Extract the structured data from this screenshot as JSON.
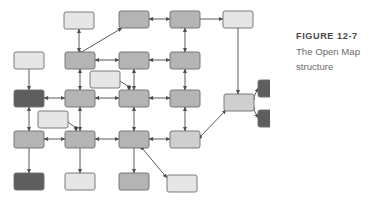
{
  "figure": {
    "label": "FIGURE 12-7",
    "caption": "The Open Map structure"
  },
  "palette": {
    "node_light": "#e6e6e6",
    "node_medium_light": "#cfcfcf",
    "node_medium": "#b4b4b4",
    "node_dark": "#5e5e5e",
    "node_stroke": "#6e6e6e",
    "edge": "#5a5a5a",
    "background": "#ffffff",
    "caption_title": "#4a4a4a",
    "caption_body": "#6b6b6b"
  },
  "diagram": {
    "type": "node-graph",
    "shape": "rounded-rectangle",
    "node_width": 30,
    "node_height": 17,
    "corner_radius": 2,
    "nodes": [
      {
        "id": "n-r0c1",
        "x": 64,
        "y": 12,
        "fill": "node_light"
      },
      {
        "id": "n-r0c2",
        "x": 119,
        "y": 11,
        "fill": "node_medium"
      },
      {
        "id": "n-r0c3",
        "x": 170,
        "y": 11,
        "fill": "node_medium"
      },
      {
        "id": "n-r0c4",
        "x": 223,
        "y": 11,
        "fill": "node_light"
      },
      {
        "id": "n-r1c0",
        "x": 14,
        "y": 52,
        "fill": "node_light"
      },
      {
        "id": "n-r1c1",
        "x": 65,
        "y": 52,
        "fill": "node_medium"
      },
      {
        "id": "n-r1c2",
        "x": 119,
        "y": 52,
        "fill": "node_medium"
      },
      {
        "id": "n-r1c3",
        "x": 170,
        "y": 52,
        "fill": "node_medium"
      },
      {
        "id": "n-off-a",
        "x": 90,
        "y": 71,
        "fill": "node_light"
      },
      {
        "id": "n-r2c0",
        "x": 14,
        "y": 90,
        "fill": "node_dark"
      },
      {
        "id": "n-r2c1",
        "x": 65,
        "y": 90,
        "fill": "node_medium"
      },
      {
        "id": "n-r2c2",
        "x": 119,
        "y": 90,
        "fill": "node_medium"
      },
      {
        "id": "n-r2c3",
        "x": 170,
        "y": 90,
        "fill": "node_medium"
      },
      {
        "id": "n-off-b",
        "x": 38,
        "y": 111,
        "fill": "node_light"
      },
      {
        "id": "n-r3c0",
        "x": 14,
        "y": 131,
        "fill": "node_medium"
      },
      {
        "id": "n-r3c1",
        "x": 65,
        "y": 131,
        "fill": "node_medium"
      },
      {
        "id": "n-r3c2",
        "x": 119,
        "y": 131,
        "fill": "node_medium"
      },
      {
        "id": "n-r3c3",
        "x": 170,
        "y": 131,
        "fill": "node_medium_light"
      },
      {
        "id": "n-r4c0",
        "x": 14,
        "y": 173,
        "fill": "node_dark"
      },
      {
        "id": "n-r4c1",
        "x": 65,
        "y": 173,
        "fill": "node_light"
      },
      {
        "id": "n-r4c2",
        "x": 119,
        "y": 173,
        "fill": "node_medium"
      },
      {
        "id": "n-off-c",
        "x": 167,
        "y": 175,
        "fill": "node_light"
      },
      {
        "id": "n-hub",
        "x": 224,
        "y": 94,
        "fill": "node_medium_light"
      },
      {
        "id": "n-leaf1",
        "x": 258,
        "y": 80,
        "fill": "node_dark",
        "w": 27
      },
      {
        "id": "n-leaf2",
        "x": 258,
        "y": 110,
        "fill": "node_dark",
        "w": 27
      }
    ],
    "edges": [
      {
        "from": "n-r0c1",
        "to": "n-r1c1",
        "style": "arrow-both",
        "path": "vertical"
      },
      {
        "from": "n-r1c1",
        "to": "n-r0c2",
        "style": "arrow-to",
        "path": "diagonal"
      },
      {
        "from": "n-r0c2",
        "to": "n-r0c3",
        "style": "arrow-both",
        "path": "horizontal"
      },
      {
        "from": "n-r0c3",
        "to": "n-r0c4",
        "style": "arrow-to",
        "path": "horizontal"
      },
      {
        "from": "n-r0c3",
        "to": "n-r1c3",
        "style": "arrow-both",
        "path": "vertical"
      },
      {
        "from": "n-r0c4",
        "to": "n-hub",
        "style": "arrow-to",
        "path": "vertical"
      },
      {
        "from": "n-r1c0",
        "to": "n-r2c0",
        "style": "arrow-to",
        "path": "vertical"
      },
      {
        "from": "n-r1c1",
        "to": "n-r1c2",
        "style": "arrow-both",
        "path": "horizontal"
      },
      {
        "from": "n-r1c2",
        "to": "n-r1c3",
        "style": "arrow-both",
        "path": "horizontal"
      },
      {
        "from": "n-r1c1",
        "to": "n-r2c1",
        "style": "arrow-both",
        "path": "vertical"
      },
      {
        "from": "n-r1c2",
        "to": "n-r2c2",
        "style": "arrow-both",
        "path": "vertical"
      },
      {
        "from": "n-r1c3",
        "to": "n-r2c3",
        "style": "arrow-both",
        "path": "vertical"
      },
      {
        "from": "n-off-a",
        "to": "n-r2c2",
        "style": "arrow-to",
        "path": "elbow"
      },
      {
        "from": "n-r2c0",
        "to": "n-r2c1",
        "style": "arrow-both",
        "path": "horizontal"
      },
      {
        "from": "n-r2c1",
        "to": "n-r2c2",
        "style": "arrow-both",
        "path": "horizontal"
      },
      {
        "from": "n-r2c2",
        "to": "n-r2c3",
        "style": "arrow-both",
        "path": "horizontal"
      },
      {
        "from": "n-r2c0",
        "to": "n-r3c0",
        "style": "arrow-both",
        "path": "vertical"
      },
      {
        "from": "n-r2c1",
        "to": "n-r3c1",
        "style": "arrow-both",
        "path": "vertical"
      },
      {
        "from": "n-r2c2",
        "to": "n-r3c2",
        "style": "arrow-both",
        "path": "vertical"
      },
      {
        "from": "n-r2c3",
        "to": "n-r3c3",
        "style": "arrow-both",
        "path": "vertical"
      },
      {
        "from": "n-off-b",
        "to": "n-r3c1",
        "style": "arrow-to",
        "path": "elbow"
      },
      {
        "from": "n-r3c0",
        "to": "n-r3c1",
        "style": "arrow-both",
        "path": "horizontal"
      },
      {
        "from": "n-r3c1",
        "to": "n-r3c2",
        "style": "arrow-both",
        "path": "horizontal"
      },
      {
        "from": "n-r3c2",
        "to": "n-r3c3",
        "style": "arrow-both",
        "path": "horizontal"
      },
      {
        "from": "n-r3c0",
        "to": "n-r4c0",
        "style": "arrow-to",
        "path": "vertical"
      },
      {
        "from": "n-r3c1",
        "to": "n-r4c1",
        "style": "arrow-to",
        "path": "vertical"
      },
      {
        "from": "n-r3c2",
        "to": "n-r4c2",
        "style": "arrow-to",
        "path": "vertical"
      },
      {
        "from": "n-r3c2",
        "to": "n-off-c",
        "style": "arrow-to",
        "path": "diagonal"
      },
      {
        "from": "n-r3c3",
        "to": "n-hub",
        "style": "arrow-to",
        "path": "diagonal"
      },
      {
        "from": "n-hub",
        "to": "n-leaf1",
        "style": "arrow-to",
        "path": "diagonal"
      },
      {
        "from": "n-hub",
        "to": "n-leaf2",
        "style": "arrow-to",
        "path": "diagonal"
      }
    ]
  }
}
